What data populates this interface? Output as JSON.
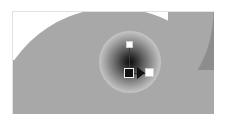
{
  "canvas": {
    "width": 226,
    "height": 124,
    "background_color": "#ffffff",
    "paper": {
      "left": 12,
      "top": 11,
      "width": 202,
      "height": 103,
      "border_color": "#e2e2e2",
      "fill_color": "#ffffff"
    }
  },
  "artwork": {
    "ellipse": {
      "name": "large-gray-ellipse",
      "fill_color": "#a8a8a8"
    },
    "corner_wedge": {
      "name": "top-right-dark-wedge",
      "fill_color": "#8d8d8d"
    },
    "floor": {
      "name": "gray-floor-band",
      "fill_color": "#a8a8a8"
    }
  },
  "gradient": {
    "type": "radial",
    "center_x": 117,
    "center_y": 61,
    "radius": 31,
    "stops": [
      {
        "offset": 0,
        "color": "#0d0d0d"
      },
      {
        "offset": 0.3,
        "color": "#5e5e5e"
      },
      {
        "offset": 0.57,
        "color": "#a5a5a5"
      },
      {
        "offset": 0.82,
        "color": "#dedede"
      },
      {
        "offset": 1,
        "color": "#ffffff"
      }
    ],
    "handles": {
      "center": {
        "label": "center-handle",
        "shape": "filled-square",
        "color": "#121212",
        "x": 116,
        "y": 61
      },
      "top": {
        "label": "radius-handle",
        "shape": "hollow-square",
        "color": "#ffffff",
        "x": 116,
        "y": 32
      },
      "focus": {
        "label": "focus-handle",
        "shape": "hollow-square",
        "color": "#ffffff",
        "x": 136,
        "y": 60
      },
      "arrow": {
        "label": "direction-arrow",
        "shape": "triangle-right",
        "color": "#121212"
      }
    }
  }
}
